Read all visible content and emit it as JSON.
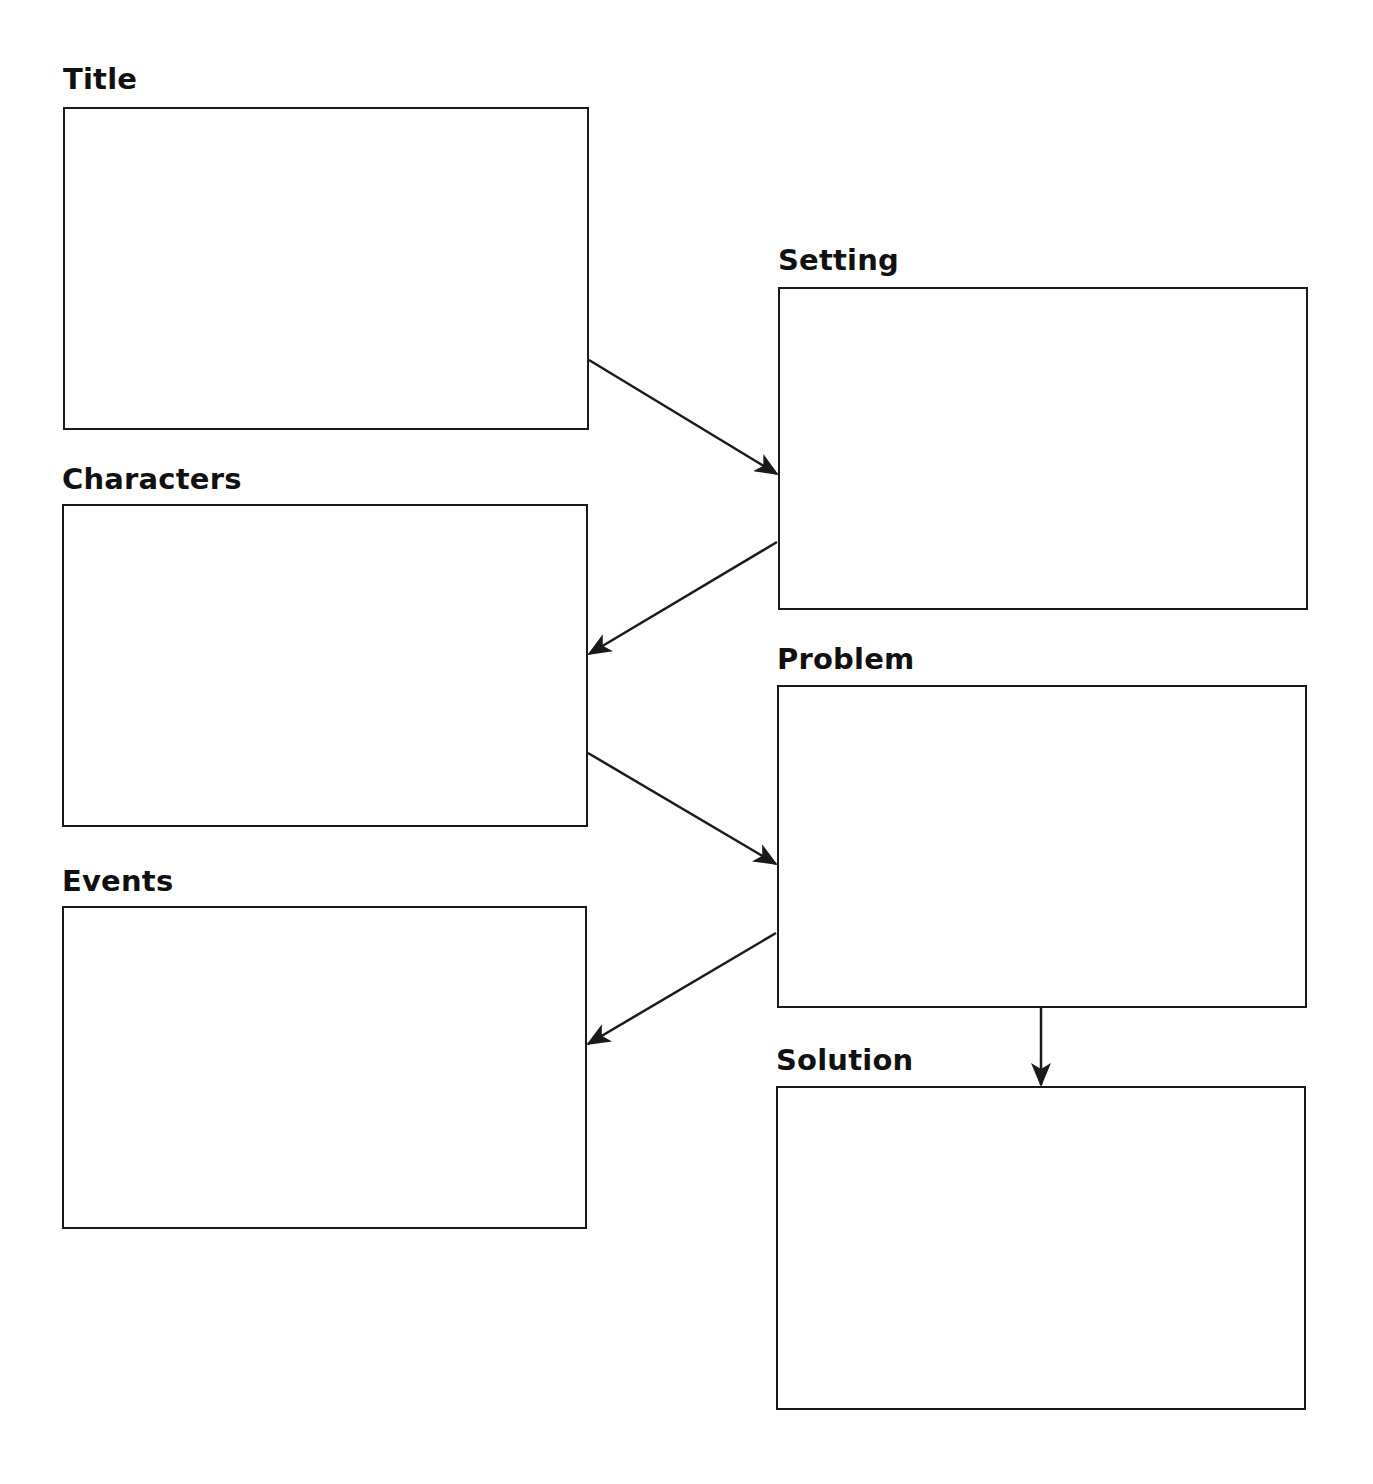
{
  "diagram": {
    "type": "story-map graphic organizer",
    "boxes": [
      {
        "id": "title",
        "label": "Title",
        "x": 63,
        "y": 107,
        "w": 526,
        "h": 323,
        "lx": 63,
        "ly": 62
      },
      {
        "id": "characters",
        "label": "Characters",
        "x": 62,
        "y": 504,
        "w": 526,
        "h": 323,
        "lx": 62,
        "ly": 462
      },
      {
        "id": "events",
        "label": "Events",
        "x": 62,
        "y": 906,
        "w": 525,
        "h": 323,
        "lx": 62,
        "ly": 864
      },
      {
        "id": "setting",
        "label": "Setting",
        "x": 778,
        "y": 287,
        "w": 530,
        "h": 323,
        "lx": 778,
        "ly": 243
      },
      {
        "id": "problem",
        "label": "Problem",
        "x": 777,
        "y": 685,
        "w": 530,
        "h": 323,
        "lx": 777,
        "ly": 642
      },
      {
        "id": "solution",
        "label": "Solution",
        "x": 776,
        "y": 1086,
        "w": 530,
        "h": 324,
        "lx": 776,
        "ly": 1043
      }
    ],
    "arrows": [
      {
        "from": "title",
        "to": "setting",
        "x1": 589,
        "y1": 360,
        "x2": 777,
        "y2": 474
      },
      {
        "from": "setting",
        "to": "characters",
        "x1": 777,
        "y1": 542,
        "x2": 589,
        "y2": 654
      },
      {
        "from": "characters",
        "to": "problem",
        "x1": 588,
        "y1": 753,
        "x2": 776,
        "y2": 864
      },
      {
        "from": "problem",
        "to": "events",
        "x1": 776,
        "y1": 933,
        "x2": 588,
        "y2": 1044
      },
      {
        "from": "problem",
        "to": "solution",
        "x1": 1041,
        "y1": 1008,
        "x2": 1041,
        "y2": 1085
      }
    ],
    "colors": {
      "stroke": "#1a1a1a",
      "background": "#ffffff",
      "text": "#111111"
    }
  }
}
